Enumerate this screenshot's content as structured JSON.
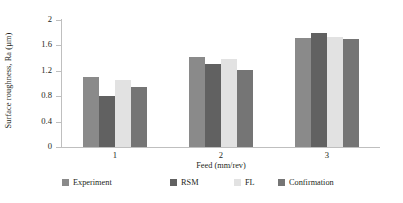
{
  "chart_data": {
    "type": "bar",
    "title": "",
    "xlabel": "Feed (mm/rev)",
    "ylabel": "Surface roughness, Ra (µm)",
    "categories": [
      "1",
      "2",
      "3"
    ],
    "ylim": [
      0,
      2
    ],
    "yticks": [
      "0",
      "0.4",
      "0.8",
      "1.2",
      "1.6",
      "2"
    ],
    "ytick_values": [
      0,
      0.4,
      0.8,
      1.2,
      1.6,
      2
    ],
    "grid": false,
    "legend_position": "bottom",
    "series": [
      {
        "name": "Experiment",
        "color": "#8a8a8a",
        "values": [
          1.1,
          1.42,
          1.72
        ]
      },
      {
        "name": "RSM",
        "color": "#616161",
        "values": [
          0.8,
          1.3,
          1.8
        ]
      },
      {
        "name": "FL",
        "color": "#e2e2e2",
        "values": [
          1.05,
          1.38,
          1.73
        ]
      },
      {
        "name": "Confirmation",
        "color": "#757575",
        "values": [
          0.95,
          1.22,
          1.7
        ]
      }
    ]
  }
}
